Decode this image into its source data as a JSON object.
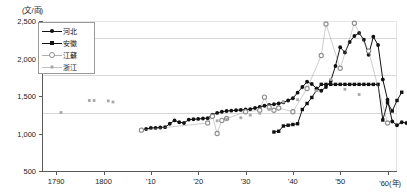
{
  "axis": {
    "y_unit_label": "(文/両)",
    "y_ticks": [
      "2,500",
      "2,000",
      "1,500",
      "1,000",
      "500"
    ],
    "y_tick_values": [
      2500,
      2000,
      1500,
      1000,
      500
    ],
    "x_ticks": [
      "1790",
      "1800",
      "'10",
      "'20",
      "'30",
      "'40",
      "'50",
      "'60"
    ],
    "x_tick_values": [
      1790,
      1800,
      1810,
      1820,
      1830,
      1840,
      1850,
      1860
    ],
    "x_unit_label": "(年)",
    "x_last_label": "'60(年)"
  },
  "legend": {
    "items": [
      {
        "label": "河北",
        "marker": "filled-circle",
        "color": "#111111"
      },
      {
        "label": "安徽",
        "marker": "filled-square",
        "color": "#111111"
      },
      {
        "label": "江蘇",
        "marker": "open-circle",
        "color": "#8d8d8d"
      },
      {
        "label": "浙江",
        "marker": "small-square",
        "color": "#a8a8a8"
      }
    ]
  },
  "chart_data": {
    "type": "line",
    "title": "",
    "subtitle": "",
    "xlabel": "(年)",
    "ylabel": "(文/両)",
    "xlim": [
      1787,
      1862
    ],
    "ylim": [
      500,
      2500
    ],
    "grid": true,
    "legend_position": "top-left-inside",
    "series": [
      {
        "name": "河北",
        "marker": "filled-circle",
        "color": "#111111",
        "points": [
          [
            1808,
            1050
          ],
          [
            1809,
            1060
          ],
          [
            1810,
            1075
          ],
          [
            1811,
            1075
          ],
          [
            1812,
            1080
          ],
          [
            1813,
            1085
          ],
          [
            1814,
            1130
          ],
          [
            1815,
            1175
          ],
          [
            1816,
            1150
          ],
          [
            1817,
            1140
          ],
          [
            1818,
            1185
          ],
          [
            1819,
            1190
          ],
          [
            1820,
            1195
          ],
          [
            1821,
            1200
          ],
          [
            1822,
            1205
          ],
          [
            1823,
            1250
          ],
          [
            1824,
            1275
          ],
          [
            1825,
            1290
          ],
          [
            1826,
            1300
          ],
          [
            1827,
            1305
          ],
          [
            1828,
            1310
          ],
          [
            1829,
            1315
          ],
          [
            1830,
            1320
          ],
          [
            1831,
            1325
          ],
          [
            1832,
            1340
          ],
          [
            1833,
            1355
          ],
          [
            1834,
            1370
          ],
          [
            1835,
            1380
          ],
          [
            1836,
            1390
          ],
          [
            1837,
            1400
          ],
          [
            1838,
            1415
          ],
          [
            1839,
            1440
          ],
          [
            1840,
            1470
          ],
          [
            1841,
            1545
          ],
          [
            1842,
            1620
          ],
          [
            1843,
            1690
          ],
          [
            1844,
            1660
          ],
          [
            1845,
            1600
          ],
          [
            1846,
            1570
          ],
          [
            1847,
            1620
          ],
          [
            1848,
            1700
          ],
          [
            1849,
            1900
          ],
          [
            1850,
            2150
          ],
          [
            1851,
            2080
          ],
          [
            1852,
            2220
          ],
          [
            1853,
            2300
          ],
          [
            1854,
            2340
          ],
          [
            1855,
            2250
          ],
          [
            1856,
            2050
          ],
          [
            1857,
            2290
          ],
          [
            1858,
            2180
          ],
          [
            1859,
            1720
          ],
          [
            1860,
            1450
          ],
          [
            1861,
            1160
          ],
          [
            1862,
            1110
          ],
          [
            1863,
            1150
          ],
          [
            1864,
            1140
          ]
        ]
      },
      {
        "name": "安徽",
        "marker": "filled-square",
        "color": "#111111",
        "points": [
          [
            1836,
            1020
          ],
          [
            1837,
            1030
          ],
          [
            1838,
            1100
          ],
          [
            1839,
            1110
          ],
          [
            1840,
            1120
          ],
          [
            1841,
            1130
          ],
          [
            1842,
            1320
          ],
          [
            1843,
            1400
          ],
          [
            1844,
            1480
          ],
          [
            1845,
            1580
          ],
          [
            1846,
            1655
          ],
          [
            1847,
            1655
          ],
          [
            1848,
            1655
          ],
          [
            1849,
            1655
          ],
          [
            1850,
            1655
          ],
          [
            1851,
            1655
          ],
          [
            1852,
            1655
          ],
          [
            1853,
            1655
          ],
          [
            1854,
            1655
          ],
          [
            1855,
            1655
          ],
          [
            1856,
            1655
          ],
          [
            1857,
            1655
          ],
          [
            1858,
            1655
          ],
          [
            1859,
            1180
          ],
          [
            1860,
            1410
          ],
          [
            1861,
            1300
          ],
          [
            1862,
            1440
          ],
          [
            1863,
            1550
          ]
        ]
      },
      {
        "name": "江蘇",
        "marker": "open-circle",
        "color": "#8d8d8d",
        "points": [
          [
            1808,
            1045
          ],
          [
            1822,
            1140
          ],
          [
            1823,
            1230
          ],
          [
            1824,
            1000
          ],
          [
            1825,
            1175
          ],
          [
            1826,
            1200
          ],
          [
            1830,
            1290
          ],
          [
            1833,
            1310
          ],
          [
            1834,
            1485
          ],
          [
            1835,
            1350
          ],
          [
            1836,
            1310
          ],
          [
            1837,
            1340
          ],
          [
            1840,
            1290
          ],
          [
            1843,
            1600
          ],
          [
            1846,
            2040
          ],
          [
            1847,
            2460
          ],
          [
            1850,
            1870
          ],
          [
            1853,
            2470
          ],
          [
            1856,
            2100
          ],
          [
            1860,
            1140
          ]
        ]
      },
      {
        "name": "浙江",
        "marker": "small-square",
        "color": "#a8a8a8",
        "points": [
          [
            1791,
            1280
          ],
          [
            1797,
            1440
          ],
          [
            1798,
            1440
          ],
          [
            1801,
            1435
          ],
          [
            1802,
            1420
          ],
          [
            1824,
            1170
          ],
          [
            1826,
            1190
          ],
          [
            1829,
            1210
          ],
          [
            1831,
            1245
          ],
          [
            1833,
            1270
          ],
          [
            1835,
            1320
          ],
          [
            1838,
            1420
          ],
          [
            1841,
            1450
          ],
          [
            1845,
            1570
          ],
          [
            1848,
            1720
          ],
          [
            1851,
            1590
          ],
          [
            1854,
            1520
          ]
        ]
      }
    ]
  }
}
